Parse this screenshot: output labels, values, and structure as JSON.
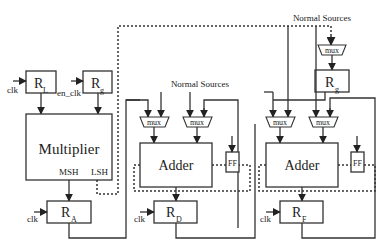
{
  "diagram": {
    "type": "block-diagram",
    "registers": {
      "rl": {
        "main": "R",
        "sub": "L"
      },
      "rg_left": {
        "main": "R",
        "sub": "g"
      },
      "rg_right": {
        "main": "R",
        "sub": "g"
      },
      "ra": {
        "main": "R",
        "sub": "A"
      },
      "rd": {
        "main": "R",
        "sub": "D"
      },
      "rf": {
        "main": "R",
        "sub": "F"
      }
    },
    "labels": {
      "clk": "clk",
      "en_clk": "en_clk",
      "multiplier": "Multiplier",
      "msh": "MSH",
      "lsh": "LSH",
      "adder": "Adder",
      "ff": "FF",
      "mux": "mux",
      "normal_sources": "Normal Sources"
    }
  }
}
